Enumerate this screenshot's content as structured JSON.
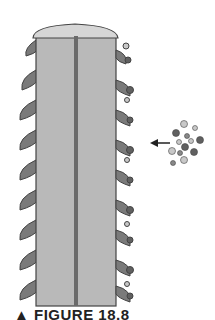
{
  "figure": {
    "caption": "▲ FIGURE 18.8",
    "colors": {
      "shaft": "#b9b9b9",
      "cap": "#d6d6d6",
      "outline": "#4a4a4a",
      "projection": "#7a7a7a",
      "center_line": "#6a6a6a",
      "particle_dark": "#606060",
      "particle_light": "#c8c8c8"
    },
    "arrow": "leftward-arrow"
  }
}
